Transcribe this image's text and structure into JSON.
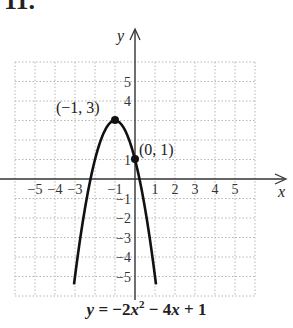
{
  "problem": {
    "number": "11."
  },
  "chart_data": {
    "type": "line",
    "title": "",
    "equation": "y = −2x² − 4x + 1",
    "xlabel": "x",
    "ylabel": "y",
    "xlim": [
      -6,
      6
    ],
    "ylim": [
      -6,
      6
    ],
    "grid": true,
    "x_ticks": [
      -5,
      -4,
      -3,
      -1,
      1,
      2,
      3,
      4,
      5
    ],
    "y_ticks": [
      5,
      4,
      1,
      -1,
      -2,
      -3,
      -4,
      -5
    ],
    "series": [
      {
        "name": "y = -2x^2 - 4x + 1",
        "x": [
          -3.0,
          -2.5,
          -2.0,
          -1.5,
          -1.0,
          -0.5,
          0.0,
          0.5,
          1.0
        ],
        "values": [
          -5,
          -1.5,
          1,
          2.5,
          3,
          2.5,
          1,
          -1.5,
          -5
        ]
      }
    ],
    "points": [
      {
        "label": "(−1, 3)",
        "x": -1,
        "y": 3
      },
      {
        "label": "(0, 1)",
        "x": 0,
        "y": 1
      }
    ]
  },
  "labels": {
    "x_axis": "x",
    "y_axis": "y",
    "vertex": "(−1, 3)",
    "intercept": "(0, 1)",
    "eq_y": "y",
    "eq_mid": " = −2",
    "eq_x": "x",
    "eq_sup": "2",
    "eq_rest1": " − 4",
    "eq_x2": "x",
    "eq_rest2": " + 1"
  }
}
